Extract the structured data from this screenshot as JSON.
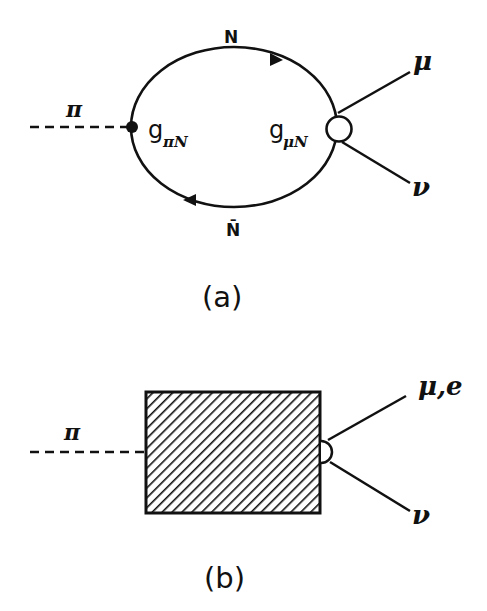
{
  "diagram_a": {
    "caption": "(a)",
    "pion_label": "π",
    "top_label": "N",
    "bottom_label": "N̄",
    "left_vertex_label": "g",
    "left_vertex_sub": "πN",
    "right_vertex_label": "g",
    "right_vertex_sub": "μN",
    "out_upper": "μ",
    "out_lower": "ν"
  },
  "diagram_b": {
    "caption": "(b)",
    "pion_label": "π",
    "out_upper": "μ,e",
    "out_lower": "ν"
  },
  "colors": {
    "ink": "#111111",
    "background": "#ffffff"
  }
}
